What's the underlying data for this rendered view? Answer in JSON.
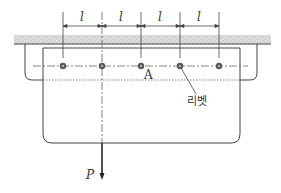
{
  "diagram": {
    "dimension_label": "l",
    "dimensions": [
      {
        "label": "l",
        "from_x": 63,
        "to_x": 102
      },
      {
        "label": "l",
        "from_x": 102,
        "to_x": 141
      },
      {
        "label": "l",
        "from_x": 141,
        "to_x": 180
      },
      {
        "label": "l",
        "from_x": 180,
        "to_x": 219
      }
    ],
    "rivets": [
      {
        "x": 63,
        "y": 66
      },
      {
        "x": 102,
        "y": 66
      },
      {
        "x": 141,
        "y": 66
      },
      {
        "x": 180,
        "y": 66
      },
      {
        "x": 219,
        "y": 66
      }
    ],
    "point_label": "A",
    "rivet_label": "리벳",
    "load_label": "P",
    "colors": {
      "line": "#333333",
      "hatch": "#bdbdbd",
      "hatch_bg": "#dcdcdc",
      "rivet": "#555555"
    }
  }
}
